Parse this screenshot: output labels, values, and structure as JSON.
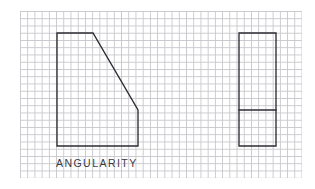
{
  "figure": {
    "caption": "ANGULARITY",
    "background_color": "#ffffff",
    "grid_color": "#c8c8cd",
    "line_color": "#2b2b33",
    "grid": {
      "name": "graph-paper",
      "x": 20,
      "y": 11,
      "width": 282,
      "height": 167,
      "cell_width": 7.22,
      "cell_height": 7.25
    },
    "shapes": [
      {
        "name": "angled-part-profile",
        "type": "polygon",
        "points": "57,33 93,33 138,110 138,146 57,146",
        "description": "front view with inclined surface"
      },
      {
        "name": "side-view-rectangle",
        "type": "polygon",
        "points": "239,33 276,33 276,146 239,146",
        "description": "side view outline"
      },
      {
        "name": "side-view-divider",
        "type": "line",
        "points": "239,110 276,110",
        "description": "horizontal edge line in side view"
      }
    ]
  }
}
